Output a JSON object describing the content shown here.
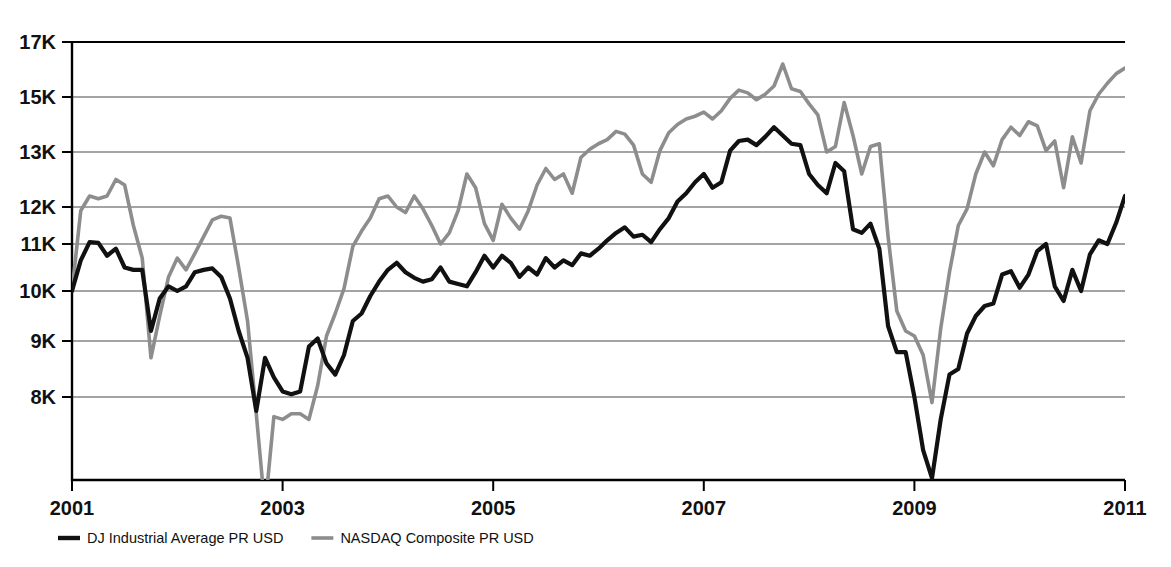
{
  "chart_data": {
    "type": "line",
    "title": "",
    "subtitle": "",
    "xlabel": "",
    "ylabel": "",
    "xlim": [
      2001.0,
      2011.0
    ],
    "ylim": [
      6000,
      17000
    ],
    "grid": true,
    "grid_axis": "y",
    "legend_position": "bottom-left",
    "x_ticks": [
      "2001",
      "2003",
      "2005",
      "2007",
      "2009",
      "2011"
    ],
    "x_tick_values": [
      2001,
      2003,
      2005,
      2007,
      2009,
      2011
    ],
    "y_ticks": [
      "8K",
      "9K",
      "10K",
      "11K",
      "12K",
      "13K",
      "15K",
      "17K"
    ],
    "y_tick_values": [
      8000,
      9000,
      10000,
      11000,
      12000,
      13000,
      15000,
      17000
    ],
    "y_axis_note": "Non-linear spacing above 13K: 13K, 15K and 17K gridlines are evenly spaced with the 1K steps below",
    "x": [
      2001.0,
      2001.083,
      2001.167,
      2001.25,
      2001.333,
      2001.417,
      2001.5,
      2001.583,
      2001.667,
      2001.75,
      2001.833,
      2001.917,
      2002.0,
      2002.083,
      2002.167,
      2002.25,
      2002.333,
      2002.417,
      2002.5,
      2002.583,
      2002.667,
      2002.75,
      2002.833,
      2002.917,
      2003.0,
      2003.083,
      2003.167,
      2003.25,
      2003.333,
      2003.417,
      2003.5,
      2003.583,
      2003.667,
      2003.75,
      2003.833,
      2003.917,
      2004.0,
      2004.083,
      2004.167,
      2004.25,
      2004.333,
      2004.417,
      2004.5,
      2004.583,
      2004.667,
      2004.75,
      2004.833,
      2004.917,
      2005.0,
      2005.083,
      2005.167,
      2005.25,
      2005.333,
      2005.417,
      2005.5,
      2005.583,
      2005.667,
      2005.75,
      2005.833,
      2005.917,
      2006.0,
      2006.083,
      2006.167,
      2006.25,
      2006.333,
      2006.417,
      2006.5,
      2006.583,
      2006.667,
      2006.75,
      2006.833,
      2006.917,
      2007.0,
      2007.083,
      2007.167,
      2007.25,
      2007.333,
      2007.417,
      2007.5,
      2007.583,
      2007.667,
      2007.75,
      2007.833,
      2007.917,
      2008.0,
      2008.083,
      2008.167,
      2008.25,
      2008.333,
      2008.417,
      2008.5,
      2008.583,
      2008.667,
      2008.75,
      2008.833,
      2008.917,
      2009.0,
      2009.083,
      2009.167,
      2009.25,
      2009.333,
      2009.417,
      2009.5,
      2009.583,
      2009.667,
      2009.75,
      2009.833,
      2009.917,
      2010.0,
      2010.083,
      2010.167,
      2010.25,
      2010.333,
      2010.417,
      2010.5,
      2010.583,
      2010.667,
      2010.75,
      2010.833,
      2010.917,
      2011.0
    ],
    "series": [
      {
        "name": "DJ Industrial Average PR USD",
        "color": "#111111",
        "width": 4.2,
        "values": [
          10000,
          10650,
          11050,
          11030,
          10750,
          10900,
          10500,
          10450,
          10450,
          9200,
          9850,
          10100,
          10000,
          10100,
          10400,
          10450,
          10480,
          10300,
          9850,
          9200,
          8700,
          7750,
          8700,
          8350,
          8100,
          8050,
          8100,
          8900,
          9050,
          8600,
          8400,
          8750,
          9400,
          9550,
          9900,
          10200,
          10450,
          10600,
          10400,
          10280,
          10200,
          10250,
          10500,
          10200,
          10150,
          10100,
          10400,
          10750,
          10500,
          10750,
          10600,
          10300,
          10500,
          10350,
          10700,
          10500,
          10650,
          10550,
          10800,
          10750,
          10900,
          11100,
          11300,
          11450,
          11200,
          11250,
          11050,
          11400,
          11700,
          12100,
          12250,
          12450,
          12600,
          12350,
          12450,
          13050,
          13400,
          13450,
          13250,
          13550,
          13900,
          13600,
          13300,
          13250,
          12600,
          12400,
          12250,
          12800,
          12650,
          11400,
          11300,
          11550,
          10900,
          9300,
          8800,
          8800,
          8000,
          7050,
          6550,
          7600,
          8400,
          8500,
          9150,
          9500,
          9700,
          9750,
          10350,
          10420,
          10070,
          10350,
          10850,
          11000,
          10100,
          9800,
          10450,
          10000,
          10780,
          11100,
          11000,
          11580,
          12200
        ]
      },
      {
        "name": "NASDAQ Composite PR USD",
        "color": "#8d8d8d",
        "width": 3.6,
        "values": [
          10000,
          11900,
          12200,
          12150,
          12200,
          12500,
          12400,
          11500,
          10700,
          8700,
          9500,
          10300,
          10700,
          10450,
          10800,
          11200,
          11650,
          11750,
          11700,
          10500,
          9400,
          7700,
          6000,
          7650,
          7600,
          7700,
          7700,
          7600,
          8200,
          9100,
          9550,
          10050,
          10950,
          11350,
          11700,
          12150,
          12200,
          12000,
          11850,
          12200,
          11950,
          11500,
          11000,
          11300,
          11900,
          12600,
          12350,
          11550,
          11100,
          12050,
          11700,
          11400,
          11900,
          12400,
          12700,
          12500,
          12600,
          12250,
          12900,
          13100,
          13300,
          13450,
          13750,
          13650,
          13250,
          12600,
          12450,
          13050,
          13700,
          14000,
          14200,
          14300,
          14450,
          14200,
          14500,
          14950,
          15250,
          15150,
          14900,
          15100,
          15400,
          16200,
          15300,
          15200,
          14750,
          14350,
          13000,
          13200,
          14800,
          13600,
          12600,
          13200,
          13300,
          11200,
          9600,
          9200,
          9100,
          8750,
          7900,
          9250,
          10400,
          11500,
          11950,
          12600,
          13000,
          12750,
          13450,
          13900,
          13600,
          14100,
          13950,
          13050,
          13400,
          12350,
          13550,
          12800,
          14500,
          15100,
          15500,
          15850,
          16050
        ]
      }
    ]
  },
  "legend": {
    "entries": [
      {
        "label": "DJ Industrial Average PR USD"
      },
      {
        "label": "NASDAQ Composite PR USD"
      }
    ]
  },
  "colors": {
    "dj_line": "#111111",
    "nasdaq_line": "#8d8d8d",
    "grid": "#4a4a4a",
    "axis": "#000000",
    "background": "#ffffff"
  }
}
